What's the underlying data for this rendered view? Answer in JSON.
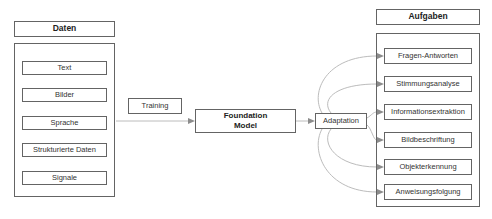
{
  "diagram": {
    "left": {
      "header": "Daten",
      "items": [
        "Text",
        "Bilder",
        "Sprache",
        "Strukturierte Daten",
        "Signale"
      ]
    },
    "flow": {
      "training": "Training",
      "model_line1": "Foundation",
      "model_line2": "Model",
      "adaptation": "Adaptation"
    },
    "right": {
      "header": "Aufgaben",
      "items": [
        "Fragen-Antworten",
        "Stimmungsanalyse",
        "Informationsextraktion",
        "Bildbeschriftung",
        "Objekterkennung",
        "Anweisungsfolgung"
      ]
    },
    "colors": {
      "box_border": "#646464",
      "connector": "#bcbcbc",
      "arrowhead": "#8c8c8c",
      "text": "#333333",
      "background": "#ffffff"
    }
  }
}
